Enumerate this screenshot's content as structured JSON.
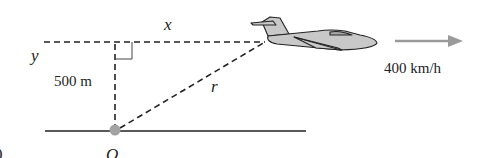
{
  "diagram": {
    "labels": {
      "x": "x",
      "y": "y",
      "r": "r",
      "origin": "O",
      "height": "500 m",
      "speed": "400 km/h",
      "edge_fragment": "0"
    },
    "colors": {
      "line": "#222222",
      "dot": "#a3a3a3",
      "arrow": "#9a9a9a",
      "plane_fill": "#c8c8c8",
      "plane_dark": "#a9a9a9"
    }
  }
}
